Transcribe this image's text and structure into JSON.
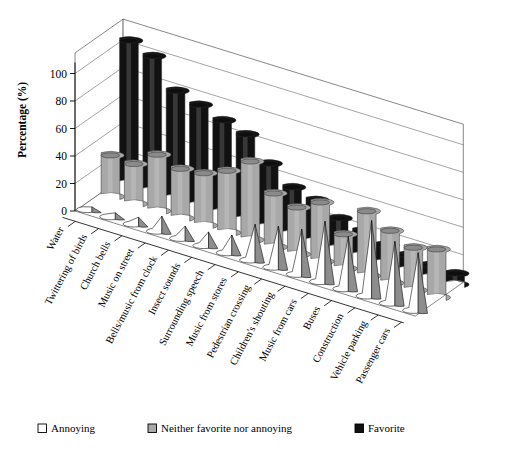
{
  "chart_data": {
    "type": "bar",
    "title": "",
    "xlabel": "",
    "ylabel": "Percentage (%)",
    "ylim": [
      0,
      100
    ],
    "yticks": [
      0,
      20,
      40,
      60,
      80,
      100
    ],
    "grid": true,
    "projection": "3d",
    "legend_position": "bottom",
    "categories": [
      "Water",
      "Twittering of birds",
      "Church bells",
      "Music on street",
      "Bells/music from clock",
      "Insect sounds",
      "Surrounding speech",
      "Music from stores",
      "Pedestrian crossing",
      "Children's shouting",
      "Music from cars",
      "Buses",
      "Construction",
      "Vehicle parking",
      "Passenger cars"
    ],
    "series": [
      {
        "name": "Annoying",
        "color": "#ffffff",
        "values": [
          2,
          3,
          5,
          11,
          9,
          10,
          13,
          26,
          30,
          33,
          44,
          38,
          55,
          45,
          42
        ]
      },
      {
        "name": "Neither favorite nor annoying",
        "color": "#a8a8a8",
        "values": [
          30,
          29,
          41,
          36,
          38,
          45,
          57,
          39,
          34,
          43,
          25,
          47,
          38,
          31,
          35
        ]
      },
      {
        "name": "Favorite",
        "color": "#111111",
        "values": [
          104,
          98,
          78,
          73,
          67,
          62,
          46,
          34,
          30,
          22,
          18,
          13,
          11,
          9,
          8
        ]
      }
    ]
  },
  "legend": {
    "items": [
      {
        "label": "Annoying",
        "swatch": "white"
      },
      {
        "label": "Neither favorite nor annoying",
        "swatch": "gray"
      },
      {
        "label": "Favorite",
        "swatch": "black"
      }
    ]
  },
  "axis": {
    "y_title": "Percentage (%)",
    "tick_labels": [
      "0",
      "20",
      "40",
      "60",
      "80",
      "100"
    ]
  }
}
